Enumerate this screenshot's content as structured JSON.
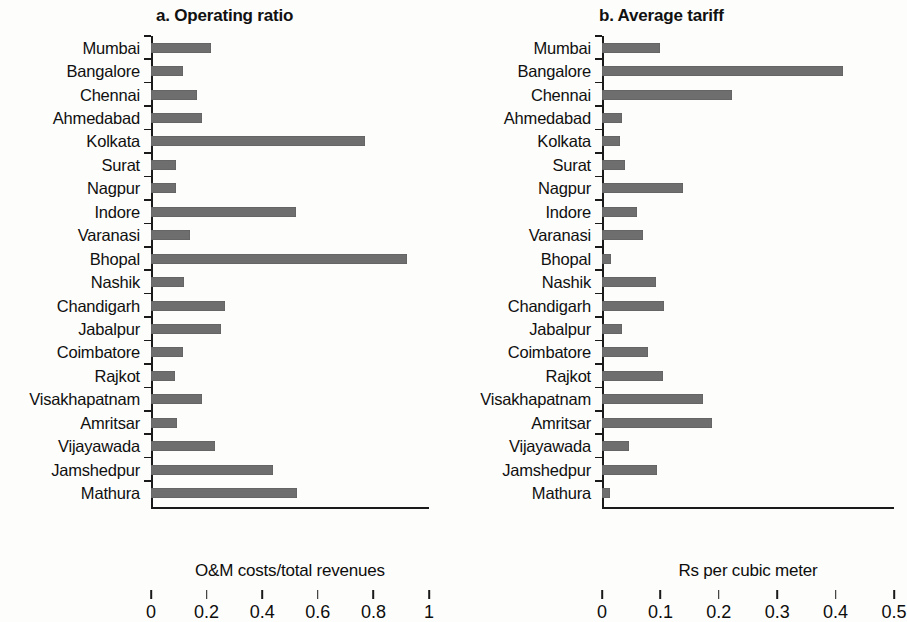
{
  "figure": {
    "background_color": "#fdfdfb",
    "bar_color": "#6e6e6e",
    "axis_color": "#1a1a1a"
  },
  "chart_data": [
    {
      "type": "bar",
      "orientation": "horizontal",
      "title": "a. Operating ratio",
      "xlabel": "O&M costs/total revenues",
      "ylabel": "",
      "xlim": [
        0,
        1
      ],
      "xticks": [
        "0",
        "0.2",
        "0.4",
        "0.6",
        "0.8",
        "1"
      ],
      "xtick_values": [
        0,
        0.2,
        0.4,
        0.6,
        0.8,
        1
      ],
      "grid": false,
      "legend": null,
      "categories": [
        "Mumbai",
        "Bangalore",
        "Chennai",
        "Ahmedabad",
        "Kolkata",
        "Surat",
        "Nagpur",
        "Indore",
        "Varanasi",
        "Bhopal",
        "Nashik",
        "Chandigarh",
        "Jabalpur",
        "Coimbatore",
        "Rajkot",
        "Visakhapatnam",
        "Amritsar",
        "Vijayawada",
        "Jamshedpur",
        "Mathura"
      ],
      "values": [
        0.215,
        0.115,
        0.165,
        0.185,
        0.77,
        0.09,
        0.09,
        0.52,
        0.14,
        0.92,
        0.12,
        0.265,
        0.25,
        0.115,
        0.085,
        0.185,
        0.095,
        0.23,
        0.44,
        0.525
      ]
    },
    {
      "type": "bar",
      "orientation": "horizontal",
      "title": "b. Average tariff",
      "xlabel": "Rs per cubic meter",
      "ylabel": "",
      "xlim": [
        0,
        0.5
      ],
      "xticks": [
        "0",
        "0.1",
        "0.2",
        "0.3",
        "0.4",
        "0.5"
      ],
      "xtick_values": [
        0,
        0.1,
        0.2,
        0.3,
        0.4,
        0.5
      ],
      "grid": false,
      "legend": null,
      "categories": [
        "Mumbai",
        "Bangalore",
        "Chennai",
        "Ahmedabad",
        "Kolkata",
        "Surat",
        "Nagpur",
        "Indore",
        "Varanasi",
        "Bhopal",
        "Nashik",
        "Chandigarh",
        "Jabalpur",
        "Coimbatore",
        "Rajkot",
        "Visakhapatnam",
        "Amritsar",
        "Vijayawada",
        "Jamshedpur",
        "Mathura"
      ],
      "values": [
        0.099,
        0.412,
        0.222,
        0.035,
        0.03,
        0.039,
        0.139,
        0.06,
        0.07,
        0.016,
        0.092,
        0.106,
        0.035,
        0.079,
        0.104,
        0.173,
        0.188,
        0.046,
        0.094,
        0.013
      ]
    }
  ]
}
